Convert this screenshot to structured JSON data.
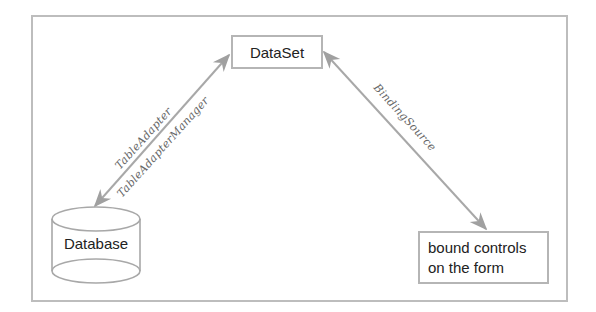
{
  "diagram": {
    "nodes": {
      "dataset": "DataSet",
      "database": "Database",
      "bound_controls_line1": "bound controls",
      "bound_controls_line2": "on the form"
    },
    "edges": {
      "left_label_1": "TableAdapter",
      "left_label_2": "TableAdapterManager",
      "right_label": "BindingSource"
    },
    "colors": {
      "line": "#a8a8a8",
      "border": "#b5b5b5",
      "text": "#222222"
    }
  }
}
